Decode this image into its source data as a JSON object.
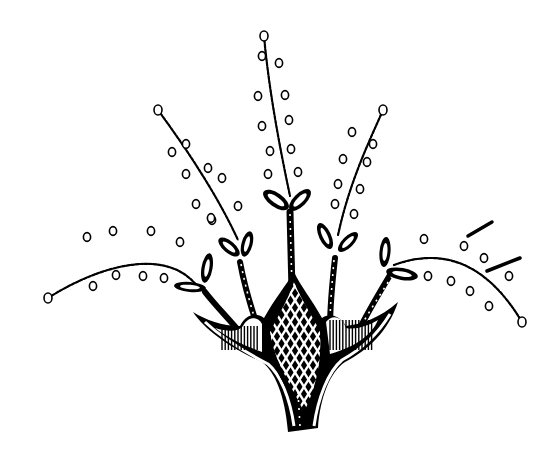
{
  "illustration": {
    "title": "",
    "subject": "stylized ink flower with dotted stamens",
    "colors": {
      "ink": "#000000",
      "paper": "#ffffff"
    },
    "canvas": {
      "width": 555,
      "height": 452
    },
    "stamens": [
      {
        "name": "center",
        "path": "M264 36 C268 80 276 130 290 196",
        "tip": [
          264,
          36
        ]
      },
      {
        "name": "left-upper",
        "path": "M158 110 C180 140 215 190 238 240",
        "tip": [
          158,
          110
        ]
      },
      {
        "name": "right-upper",
        "path": "M383 110 C370 140 350 180 338 235",
        "tip": [
          383,
          110
        ]
      },
      {
        "name": "left-lower",
        "path": "M48 298 C100 265 170 245 200 290",
        "tip": [
          48,
          298
        ]
      },
      {
        "name": "right-lower",
        "path": "M394 265 C440 248 485 260 522 322",
        "tip": [
          522,
          322
        ]
      }
    ],
    "dots": [
      [
        262,
        56
      ],
      [
        279,
        63
      ],
      [
        258,
        96
      ],
      [
        285,
        95
      ],
      [
        262,
        126
      ],
      [
        289,
        120
      ],
      [
        270,
        151
      ],
      [
        291,
        149
      ],
      [
        268,
        174
      ],
      [
        298,
        172
      ],
      [
        186,
        144
      ],
      [
        172,
        152
      ],
      [
        208,
        168
      ],
      [
        186,
        174
      ],
      [
        196,
        204
      ],
      [
        222,
        178
      ],
      [
        212,
        220
      ],
      [
        238,
        206
      ],
      [
        352,
        132
      ],
      [
        373,
        144
      ],
      [
        343,
        159
      ],
      [
        367,
        162
      ],
      [
        338,
        184
      ],
      [
        360,
        189
      ],
      [
        335,
        204
      ],
      [
        354,
        214
      ],
      [
        87,
        237
      ],
      [
        113,
        231
      ],
      [
        151,
        231
      ],
      [
        180,
        242
      ],
      [
        93,
        286
      ],
      [
        116,
        275
      ],
      [
        143,
        276
      ],
      [
        164,
        278
      ],
      [
        211,
        218
      ],
      [
        424,
        239
      ],
      [
        464,
        246
      ],
      [
        428,
        276
      ],
      [
        451,
        281
      ],
      [
        470,
        291
      ],
      [
        484,
        258
      ],
      [
        509,
        276
      ],
      [
        489,
        306
      ]
    ],
    "leaf_pairs": [
      {
        "name": "center-leaves",
        "x": 290,
        "y": 208
      },
      {
        "name": "left-upper-leaves",
        "x": 240,
        "y": 255
      },
      {
        "name": "right-upper-leaves",
        "x": 335,
        "y": 250
      },
      {
        "name": "left-lower-leaves",
        "x": 205,
        "y": 288
      },
      {
        "name": "right-lower-leaves",
        "x": 390,
        "y": 270
      }
    ],
    "petal_marks": [
      {
        "x1": 468,
        "y1": 236,
        "x2": 492,
        "y2": 222
      },
      {
        "x1": 487,
        "y1": 271,
        "x2": 520,
        "y2": 258
      }
    ]
  }
}
